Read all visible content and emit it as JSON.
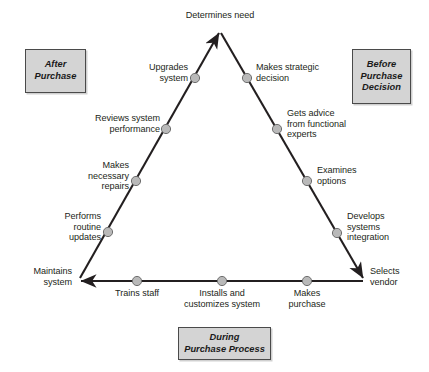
{
  "diagram": {
    "type": "cycle-triangle",
    "colors": {
      "line": "#231f20",
      "node_fill": "#b9b9b9",
      "node_stroke": "#6e6e6e",
      "box_fill": "#d4d4d4",
      "box_stroke": "#4a4a4a",
      "text": "#231f20"
    },
    "corners": [
      {
        "id": "apex",
        "label": "Determines need",
        "x": 220,
        "y": 30,
        "align": "center"
      },
      {
        "id": "bottom-right",
        "label": "Selects\nvendor",
        "x": 365,
        "y": 281,
        "align": "left"
      },
      {
        "id": "bottom-left",
        "label": "Maintains\nsystem",
        "x": 78,
        "y": 281,
        "align": "right"
      }
    ],
    "nodes": [
      {
        "id": "makes-strategic-decision",
        "label": "Makes strategic\ndecision",
        "edge": "right",
        "x": 250,
        "y": 78,
        "align": "left"
      },
      {
        "id": "gets-advice",
        "label": "Gets advice\nfrom functional\nexperts",
        "edge": "right",
        "x": 281,
        "y": 129,
        "align": "left"
      },
      {
        "id": "examines-options",
        "label": "Examines\noptions",
        "edge": "right",
        "x": 310,
        "y": 180,
        "align": "left"
      },
      {
        "id": "develops-systems-integration",
        "label": "Develops\nsystems\nintegration",
        "edge": "right",
        "x": 340,
        "y": 232,
        "align": "left"
      },
      {
        "id": "makes-purchase",
        "label": "Makes\npurchase",
        "edge": "bottom",
        "x": 307,
        "y": 281,
        "align": "center"
      },
      {
        "id": "installs-customizes-system",
        "label": "Installs and\ncustomizes system",
        "edge": "bottom",
        "x": 222,
        "y": 281,
        "align": "center"
      },
      {
        "id": "trains-staff",
        "label": "Trains staff",
        "edge": "bottom",
        "x": 137,
        "y": 281,
        "align": "center"
      },
      {
        "id": "performs-routine-updates",
        "label": "Performs\nroutine\nupdates",
        "edge": "left",
        "x": 108,
        "y": 232,
        "align": "right"
      },
      {
        "id": "makes-necessary-repairs",
        "label": "Makes\nnecessary\nrepairs",
        "edge": "left",
        "x": 136,
        "y": 180,
        "align": "right"
      },
      {
        "id": "reviews-system-performance",
        "label": "Reviews system\nperformance",
        "edge": "left",
        "x": 167,
        "y": 129,
        "align": "right"
      },
      {
        "id": "upgrades-system",
        "label": "Upgrades\nsystem",
        "edge": "left",
        "x": 194,
        "y": 78,
        "align": "right"
      }
    ],
    "phases": [
      {
        "id": "after-purchase",
        "label": "After\nPurchase"
      },
      {
        "id": "before-purchase",
        "label": "Before\nPurchase\nDecision"
      },
      {
        "id": "during-purchase",
        "label": "During\nPurchase Process"
      }
    ]
  }
}
